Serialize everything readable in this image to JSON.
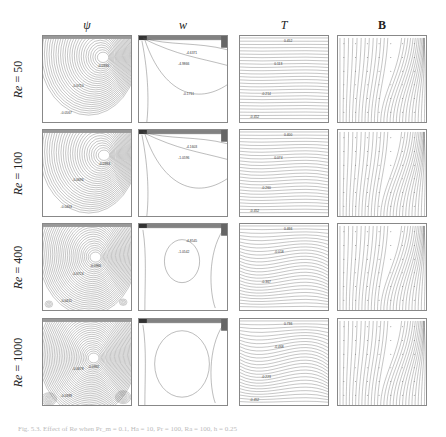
{
  "figure": {
    "columns": [
      {
        "symbol": "ψ",
        "style": "italic",
        "meaning": "stream function"
      },
      {
        "symbol": "w",
        "style": "italic",
        "meaning": "vorticity"
      },
      {
        "symbol": "T",
        "style": "italic",
        "meaning": "temperature"
      },
      {
        "symbol": "B",
        "style": "bold",
        "meaning": "magnetic field lines"
      }
    ],
    "rows": [
      {
        "label_prefix": "Re",
        "label_eq": " = 50",
        "psi_labels": [
          "-0.0936",
          "-0.0710",
          "-0.0567"
        ],
        "w_labels": [
          "-4.6371",
          "-4.9866",
          "-0.1711"
        ],
        "T_labels": [
          "0.452",
          "0.113",
          "-0.214",
          "-0.452"
        ]
      },
      {
        "label_prefix": "Re",
        "label_eq": " = 100",
        "psi_labels": [
          "-0.0994",
          "-0.0696",
          "-0.0463"
        ],
        "w_labels": [
          "-4.1603",
          "-1.0596"
        ],
        "T_labels": [
          "0.400",
          "0.074",
          "-0.260",
          "-0.452"
        ]
      },
      {
        "label_prefix": "Re",
        "label_eq": " = 400",
        "psi_labels": [
          "-0.0966",
          "-0.0724",
          "-0.0415"
        ],
        "w_labels": [
          "-4.8545",
          "-1.0542"
        ],
        "T_labels": [
          "0.466",
          "-0.018",
          "-0.367"
        ]
      },
      {
        "label_prefix": "Re",
        "label_eq": " = 1000",
        "psi_labels": [
          "-0.0992",
          "-0.0678",
          "-0.0399"
        ],
        "w_labels": [],
        "T_labels": [
          "0.736",
          "-0.468",
          "-0.223",
          "-0.452"
        ]
      }
    ],
    "caption": "Fig. 5.3. Effect of Re when Pr_m = 0.1, Ha = 10, Pr = 100, Ra = 100, h = 0.25"
  }
}
